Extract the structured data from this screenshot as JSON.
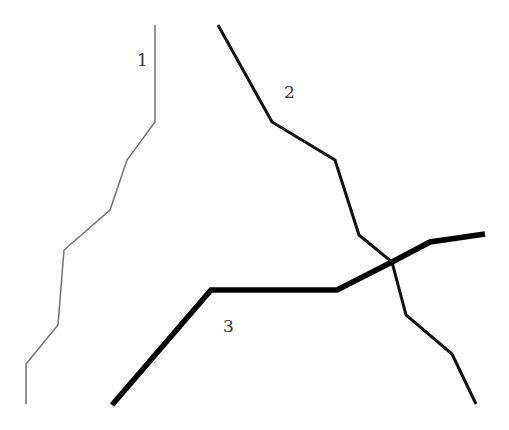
{
  "diagram": {
    "type": "polyline-paths",
    "background": "#ffffff",
    "paths": [
      {
        "id": "1",
        "label": "1",
        "stroke": "#707070",
        "stroke_width": 1.5,
        "points": [
          [
            155,
            25
          ],
          [
            155,
            122
          ],
          [
            127,
            160
          ],
          [
            110,
            210
          ],
          [
            64,
            250
          ],
          [
            58,
            325
          ],
          [
            26,
            364
          ],
          [
            26,
            404
          ]
        ],
        "label_pos": [
          137,
          66
        ]
      },
      {
        "id": "2",
        "label": "2",
        "stroke": "#111111",
        "stroke_width": 3,
        "points": [
          [
            218,
            25
          ],
          [
            272,
            122
          ],
          [
            335,
            160
          ],
          [
            359,
            235
          ],
          [
            392,
            262
          ],
          [
            406,
            315
          ],
          [
            452,
            354
          ],
          [
            476,
            404
          ]
        ],
        "label_pos": [
          284,
          98
        ]
      },
      {
        "id": "3",
        "label": "3",
        "stroke": "#000000",
        "stroke_width": 5.5,
        "points": [
          [
            112,
            405
          ],
          [
            211,
            290
          ],
          [
            337,
            290
          ],
          [
            392,
            262
          ],
          [
            430,
            242
          ],
          [
            485,
            234
          ]
        ],
        "label_pos": [
          223,
          332
        ]
      }
    ]
  }
}
